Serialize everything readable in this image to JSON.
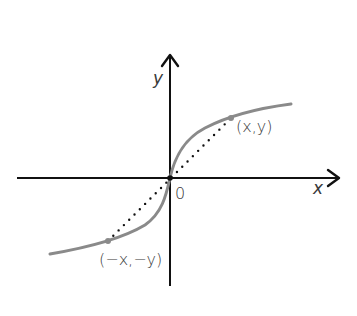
{
  "diagram": {
    "type": "odd-function-symmetry",
    "axes": {
      "x_label": "x",
      "y_label": "y",
      "origin_label": "0"
    },
    "points": [
      {
        "label": "(x,y)",
        "px": 231,
        "py": 118
      },
      {
        "label": "(−x,−y)",
        "px": 108,
        "py": 241
      }
    ],
    "colors": {
      "axis": "#111111",
      "curve": "#8a8a8a",
      "dots": "#111111",
      "text": "#3a3a3a"
    }
  }
}
